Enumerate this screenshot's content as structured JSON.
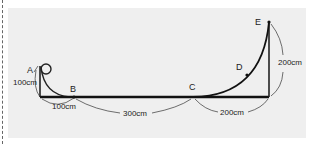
{
  "diagram": {
    "points": {
      "A": "A",
      "B": "B",
      "C": "C",
      "D": "D",
      "E": "E"
    },
    "dimensions": {
      "height_A": "100cm",
      "width_AB": "100cm",
      "length_BC": "300cm",
      "width_CE": "200cm",
      "height_E": "200cm"
    }
  }
}
